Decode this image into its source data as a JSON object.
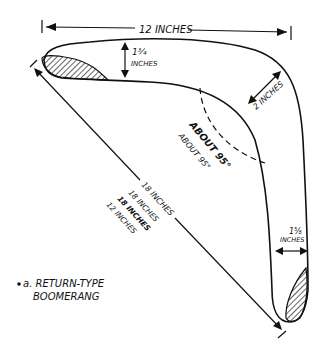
{
  "diagram": {
    "caption_line1": "a. RETURN-TYPE",
    "caption_line2": "BOOMERANG",
    "labels": {
      "span_width": "12 INCHES",
      "arm_width_left_value": "1¾",
      "arm_width_left_unit": "INCHES",
      "elbow_width": "2 INCHES",
      "arm_width_right_value": "1⅝",
      "arm_width_right_unit": "INCHES",
      "angle_primary": "ABOUT 95°",
      "angle_secondary": "ABOUT 95°",
      "diagonal_primary": "18 INCHES",
      "diagonal_alt_1": "18 INCHES",
      "diagonal_alt_2": "18 INCHES",
      "diagonal_alt_3": "12 INCHES"
    },
    "colors": {
      "ink": "#111111",
      "background": "#ffffff"
    }
  }
}
